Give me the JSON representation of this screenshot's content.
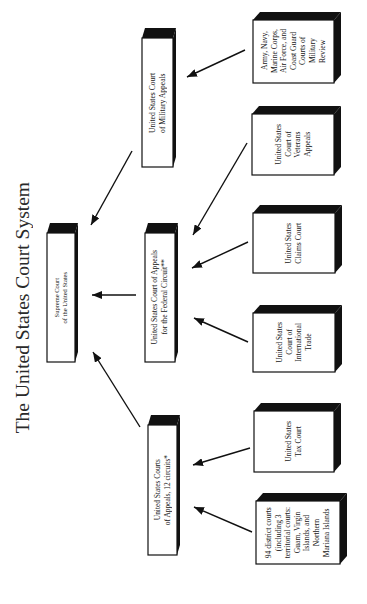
{
  "title": "The United States Court System",
  "boxes": [
    {
      "id": "supreme-court",
      "lines": [
        "Supreme Court",
        "of the United States"
      ]
    },
    {
      "id": "court-of-military-appeals",
      "lines": [
        "United States Court",
        "of Military Appeals"
      ]
    },
    {
      "id": "court-of-appeals-federal-circuit",
      "lines": [
        "United States Court of Appeals",
        "for the Federal Circuit**"
      ]
    },
    {
      "id": "courts-of-appeals-12-circuits",
      "lines": [
        "United States Courts",
        "of Appeals, 12 circuits*"
      ]
    },
    {
      "id": "courts-of-military-review",
      "lines": [
        "Army, Navy,",
        "Marine Corps,",
        "Air Force, and",
        "Coast Guard",
        "Courts of",
        "Military",
        "Review"
      ]
    },
    {
      "id": "court-of-veterans-appeals",
      "lines": [
        "United States",
        "Court of",
        "Veterans",
        "Appeals"
      ]
    },
    {
      "id": "claims-court",
      "lines": [
        "United States",
        "Claims Court"
      ]
    },
    {
      "id": "court-of-international-trade",
      "lines": [
        "United States",
        "Court of",
        "International",
        "Trade"
      ]
    },
    {
      "id": "tax-court",
      "lines": [
        "United States",
        "Tax Court"
      ]
    },
    {
      "id": "district-courts",
      "lines": [
        "94 district courts",
        "(including 3",
        "territorial courts:",
        "Guam, Virgin",
        "Islands, and",
        "Northern",
        "Mariana Islands"
      ]
    }
  ],
  "edges": [
    {
      "from": "courts-of-military-review",
      "to": "court-of-military-appeals"
    },
    {
      "from": "court-of-veterans-appeals",
      "to": "court-of-appeals-federal-circuit"
    },
    {
      "from": "claims-court",
      "to": "court-of-appeals-federal-circuit"
    },
    {
      "from": "court-of-international-trade",
      "to": "court-of-appeals-federal-circuit"
    },
    {
      "from": "tax-court",
      "to": "courts-of-appeals-12-circuits"
    },
    {
      "from": "district-courts",
      "to": "courts-of-appeals-12-circuits"
    },
    {
      "from": "court-of-military-appeals",
      "to": "supreme-court"
    },
    {
      "from": "court-of-appeals-federal-circuit",
      "to": "supreme-court"
    },
    {
      "from": "courts-of-appeals-12-circuits",
      "to": "supreme-court"
    }
  ],
  "colors": {
    "ink": "#111111",
    "background": "#ffffff"
  }
}
